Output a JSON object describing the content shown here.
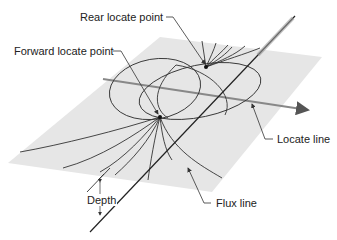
{
  "diagram": {
    "labels": {
      "rear_locate_point": "Rear locate point",
      "forward_locate_point": "Forward locate point",
      "locate_line": "Locate line",
      "flux_line": "Flux line",
      "depth": "Depth"
    },
    "colors": {
      "plane": "#e6e6e6",
      "line": "#333333",
      "locate_line": "#777777",
      "text": "#222222"
    }
  }
}
